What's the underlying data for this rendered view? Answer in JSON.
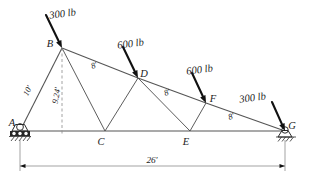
{
  "figure": {
    "type": "truss-free-body-diagram",
    "background_color": "#ffffff",
    "line_color": "#4a4a4a",
    "text_color": "#1b1b1b"
  },
  "nodes": [
    {
      "id": "A",
      "label": "A",
      "x": 20,
      "y": 131,
      "label_x": 12,
      "label_y": 126
    },
    {
      "id": "B",
      "label": "B",
      "x": 62,
      "y": 48,
      "label_x": 50,
      "label_y": 47
    },
    {
      "id": "C",
      "label": "C",
      "x": 105,
      "y": 131,
      "label_x": 101,
      "label_y": 145
    },
    {
      "id": "D",
      "label": "D",
      "x": 138,
      "y": 78,
      "label_x": 144,
      "label_y": 77
    },
    {
      "id": "E",
      "label": "E",
      "x": 190,
      "y": 131,
      "label_x": 186,
      "label_y": 145
    },
    {
      "id": "F",
      "label": "F",
      "x": 206,
      "y": 103,
      "label_x": 213,
      "label_y": 102
    },
    {
      "id": "G",
      "label": "G",
      "x": 285,
      "y": 131,
      "label_x": 292,
      "label_y": 129
    }
  ],
  "members": [
    {
      "from": "A",
      "to": "B",
      "kind": "top-chord"
    },
    {
      "from": "B",
      "to": "D",
      "kind": "top-chord"
    },
    {
      "from": "D",
      "to": "F",
      "kind": "top-chord"
    },
    {
      "from": "F",
      "to": "G",
      "kind": "top-chord"
    },
    {
      "from": "A",
      "to": "G",
      "kind": "bottom-chord"
    },
    {
      "from": "B",
      "to": "C",
      "kind": "web"
    },
    {
      "from": "C",
      "to": "D",
      "kind": "web"
    },
    {
      "from": "D",
      "to": "E",
      "kind": "web"
    },
    {
      "from": "E",
      "to": "F",
      "kind": "web"
    }
  ],
  "loads": [
    {
      "id": "load-b",
      "label": "300 lb",
      "at_node": "B",
      "label_x": 63,
      "label_y": 17,
      "tail_x": 46,
      "tail_y": 15,
      "head_x": 62,
      "head_y": 48
    },
    {
      "id": "load-d",
      "label": "600 lb",
      "at_node": "D",
      "label_x": 131,
      "label_y": 47,
      "tail_x": 123,
      "tail_y": 47,
      "head_x": 138,
      "head_y": 78
    },
    {
      "id": "load-f",
      "label": "600 lb",
      "at_node": "F",
      "label_x": 200,
      "label_y": 73,
      "tail_x": 192,
      "tail_y": 73,
      "head_x": 206,
      "head_y": 103
    },
    {
      "id": "load-g",
      "label": "300 lb",
      "at_node": "G",
      "label_x": 253,
      "label_y": 101,
      "tail_x": 272,
      "tail_y": 102,
      "head_x": 285,
      "head_y": 131
    }
  ],
  "dimensions": [
    {
      "id": "dim-ab",
      "label": "10'",
      "x": 30,
      "y": 92,
      "rotation": -63
    },
    {
      "id": "dim-height",
      "label": "9.24'",
      "x": 59,
      "y": 96,
      "rotation": -80
    },
    {
      "id": "dim-bd",
      "label": "8'",
      "x": 95,
      "y": 68,
      "rotation": -22
    },
    {
      "id": "dim-df",
      "label": "8'",
      "x": 168,
      "y": 95,
      "rotation": -22
    },
    {
      "id": "dim-fg",
      "label": "8'",
      "x": 232,
      "y": 119,
      "rotation": -19
    },
    {
      "id": "dim-span",
      "label": "26'",
      "x": 152,
      "y": 163,
      "rotation": 0
    }
  ],
  "span_dimension": {
    "label": "26'",
    "left_x": 20,
    "right_x": 285,
    "y": 166,
    "extension_top_y": 140
  },
  "supports": [
    {
      "id": "support-a",
      "node": "A",
      "type": "pin-roller",
      "x": 20,
      "y": 131
    },
    {
      "id": "support-g",
      "node": "G",
      "type": "pin",
      "x": 285,
      "y": 131
    }
  ],
  "guide_line": {
    "id": "height-dashed-line",
    "from_x": 62,
    "from_y": 48,
    "to_x": 62,
    "to_y": 136,
    "style": "dashed"
  }
}
